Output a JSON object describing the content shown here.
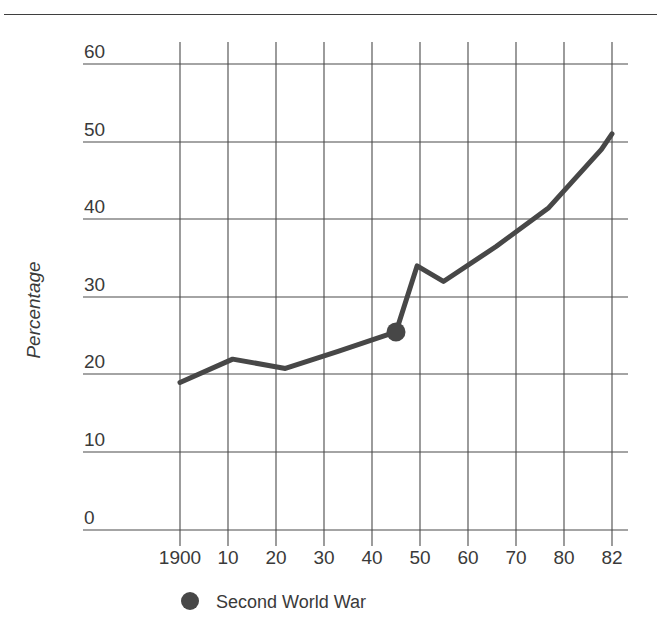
{
  "chart_data": {
    "type": "line",
    "title": "",
    "xlabel": "",
    "ylabel": "Percentage",
    "xlim": [
      1900,
      1982
    ],
    "ylim": [
      0,
      60
    ],
    "grid": true,
    "legend_position": "bottom-left",
    "x_tick_labels": [
      "1900",
      "10",
      "20",
      "30",
      "40",
      "50",
      "60",
      "70",
      "80",
      "82"
    ],
    "x_tick_values": [
      1900,
      1910,
      1920,
      1930,
      1940,
      1950,
      1960,
      1970,
      1980,
      1982
    ],
    "y_tick_labels": [
      "0",
      "10",
      "20",
      "30",
      "40",
      "50",
      "60"
    ],
    "y_tick_values": [
      0,
      10,
      20,
      30,
      40,
      50,
      60
    ],
    "series": [
      {
        "name": "Percentage",
        "color": "#474747",
        "x": [
          1900,
          1910,
          1920,
          1930,
          1941,
          1945,
          1950,
          1960,
          1970,
          1980,
          1982
        ],
        "values": [
          19.0,
          22.0,
          20.8,
          23.0,
          25.5,
          34.0,
          32.0,
          36.5,
          41.5,
          49.0,
          51.0
        ]
      }
    ],
    "annotations": [
      {
        "name": "second-world-war-marker",
        "label": "Second World War",
        "x": 1941,
        "y": 25.5,
        "marker": "filled-circle",
        "color": "#474747"
      }
    ],
    "legend": [
      {
        "label": "Second World War",
        "marker": "filled-circle",
        "color": "#474747"
      }
    ]
  },
  "colors": {
    "line": "#474747",
    "grid": "#4a4a4a",
    "text": "#3a3a3a",
    "background": "#ffffff",
    "top_rule": "#3f3f3f"
  },
  "legend_entry_label": "Second World War"
}
